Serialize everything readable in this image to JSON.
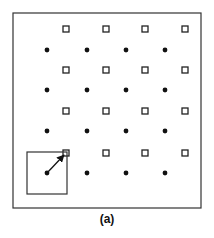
{
  "figure": {
    "caption": "(a)",
    "frame": {
      "x": 13,
      "y": 13,
      "width": 188,
      "height": 195
    },
    "square_marker": {
      "shape": "hollow-square",
      "size": 6,
      "color": "#222222"
    },
    "dot_marker": {
      "shape": "filled-circle",
      "radius": 2.4,
      "color": "#111111"
    },
    "squares": {
      "columns_x": [
        66,
        106,
        145,
        185
      ],
      "rows_y": [
        29,
        70,
        111,
        153
      ]
    },
    "dots": {
      "columns_x": [
        47,
        87,
        126,
        165
      ],
      "rows_y": [
        50,
        90,
        131,
        173
      ]
    },
    "highlight_box": {
      "x": 27,
      "y": 152,
      "width": 40,
      "height": 42
    },
    "arrow": {
      "from": [
        47,
        173
      ],
      "to": [
        64,
        155
      ]
    }
  }
}
